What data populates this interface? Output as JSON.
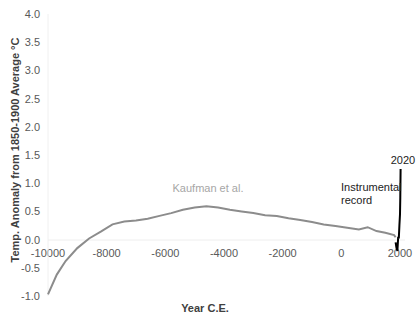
{
  "chart_data": {
    "type": "line",
    "title": "",
    "xlabel": "Year C.E.",
    "ylabel": "Temp. Anomaly from 1850-1900 Average °C",
    "xlim": [
      -10000,
      2020
    ],
    "ylim": [
      -1.0,
      4.0
    ],
    "x_ticks": [
      "-10000",
      "-8000",
      "-6000",
      "-4000",
      "-2000",
      "0",
      "2000"
    ],
    "y_ticks": [
      "-1.0",
      "-0.5",
      "0.0",
      "0.5",
      "1.0",
      "1.5",
      "2.0",
      "2.5",
      "3.0",
      "3.5",
      "4.0"
    ],
    "grid": false,
    "legend": "none (inline annotations)",
    "series": [
      {
        "name": "Kaufman et al.",
        "color": "#8c8c8c",
        "x": [
          -10000,
          -9700,
          -9400,
          -9000,
          -8600,
          -8200,
          -7800,
          -7400,
          -7000,
          -6600,
          -6200,
          -5800,
          -5400,
          -5000,
          -4600,
          -4200,
          -3800,
          -3400,
          -3000,
          -2600,
          -2200,
          -1800,
          -1400,
          -1000,
          -600,
          -200,
          200,
          600,
          900,
          1200,
          1500,
          1800,
          1850
        ],
        "y": [
          -0.97,
          -0.62,
          -0.38,
          -0.15,
          0.02,
          0.14,
          0.27,
          0.32,
          0.34,
          0.37,
          0.42,
          0.47,
          0.53,
          0.57,
          0.59,
          0.57,
          0.53,
          0.5,
          0.47,
          0.43,
          0.42,
          0.38,
          0.35,
          0.31,
          0.27,
          0.24,
          0.21,
          0.18,
          0.22,
          0.15,
          0.12,
          0.08,
          0.04
        ]
      },
      {
        "name": "Instrumental record",
        "color": "#000000",
        "x": [
          1850,
          1880,
          1910,
          1940,
          1960,
          1980,
          2000,
          2010,
          2020
        ],
        "y": [
          -0.05,
          -0.15,
          -0.2,
          0.05,
          0.02,
          0.25,
          0.45,
          0.75,
          1.25
        ]
      }
    ],
    "annotations": [
      {
        "text": "Kaufman et al.",
        "x": -4500,
        "y": 0.85
      },
      {
        "text": "Instrumental record",
        "x": 600,
        "y": 0.75
      },
      {
        "text": "2020",
        "x": 2020,
        "y": 1.35
      }
    ]
  },
  "labels": {
    "kaufman": "Kaufman et al.",
    "instrumental_line1": "Instrumental",
    "instrumental_line2": "record",
    "year_2020": "2020",
    "xlabel": "Year C.E.",
    "ylabel": "Temp. Anomaly from 1850-1900 Average °C"
  }
}
